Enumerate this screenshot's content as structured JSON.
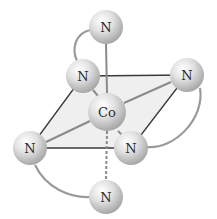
{
  "diagram": {
    "central_atom": {
      "label": "Co",
      "x": 107,
      "y": 112,
      "r": 19
    },
    "ligands": [
      {
        "id": "n-top",
        "label": "N",
        "x": 106,
        "y": 27,
        "r": 17
      },
      {
        "id": "n-upper-left",
        "label": "N",
        "x": 83,
        "y": 76,
        "r": 17
      },
      {
        "id": "n-right",
        "label": "N",
        "x": 187,
        "y": 75,
        "r": 17
      },
      {
        "id": "n-left",
        "label": "N",
        "x": 30,
        "y": 148,
        "r": 17
      },
      {
        "id": "n-lower-right",
        "label": "N",
        "x": 131,
        "y": 148,
        "r": 17
      },
      {
        "id": "n-bottom",
        "label": "N",
        "x": 106,
        "y": 197,
        "r": 17
      }
    ],
    "colors": {
      "plane_fill": "#ececec",
      "bond": "#8a8a8a",
      "edge": "#3a3a3a",
      "chelate_arc": "#9a9a9a",
      "sphere_light": "#ffffff",
      "sphere_dark": "#a9a9a9"
    }
  }
}
